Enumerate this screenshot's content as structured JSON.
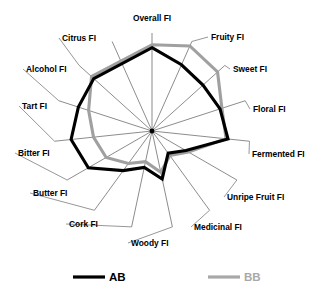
{
  "chart_data": {
    "type": "radar",
    "title": "",
    "subtitle": "",
    "xlabel": "",
    "ylabel": "",
    "grid": false,
    "legend_position": "bottom",
    "rlim": [
      0,
      10
    ],
    "axis_count": 15,
    "categories": [
      "Overall FI",
      "Fruity FI",
      "Sweet FI",
      "Floral FI",
      "Fermented FI",
      "Unripe Fruit FI",
      "Medicinal FI",
      "Woody FI",
      "Cork FI",
      "Butter FI",
      "Bitter FI",
      "Tart FI",
      "Alcohol FI",
      "Citrus FI"
    ],
    "series": [
      {
        "name": "AB",
        "color": "#000000",
        "values": [
          8.5,
          7.4,
          7.0,
          7.3,
          7.8,
          4.0,
          2.8,
          5.0,
          3.8,
          5.0,
          7.5,
          8.3,
          7.9,
          8.0
        ]
      },
      {
        "name": "BB",
        "color": "#a0a0a0",
        "values": [
          8.8,
          9.5,
          9.0,
          7.5,
          7.6,
          4.3,
          3.1,
          4.3,
          3.2,
          4.1,
          5.4,
          6.0,
          6.8,
          8.3
        ]
      }
    ]
  },
  "axis_labels": [
    {
      "text": "Overall FI",
      "x": 152,
      "y": 21,
      "anchor": "middle"
    },
    {
      "text": "Fruity FI",
      "x": 211,
      "y": 40,
      "anchor": "start"
    },
    {
      "text": "Sweet FI",
      "x": 233,
      "y": 72,
      "anchor": "start"
    },
    {
      "text": "Floral FI",
      "x": 253,
      "y": 112,
      "anchor": "start"
    },
    {
      "text": "Fermented FI",
      "x": 252,
      "y": 157,
      "anchor": "start"
    },
    {
      "text": "Unripe Fruit FI",
      "x": 227,
      "y": 200,
      "anchor": "start"
    },
    {
      "text": "Medicinal FI",
      "x": 194,
      "y": 230,
      "anchor": "start"
    },
    {
      "text": "Woody FI",
      "x": 131,
      "y": 246,
      "anchor": "start"
    },
    {
      "text": "Cork FI",
      "x": 69,
      "y": 227,
      "anchor": "start"
    },
    {
      "text": "Butter FI",
      "x": 33,
      "y": 196,
      "anchor": "start"
    },
    {
      "text": "Bitter FI",
      "x": 18,
      "y": 156,
      "anchor": "start"
    },
    {
      "text": "Tart FI",
      "x": 22,
      "y": 109,
      "anchor": "start"
    },
    {
      "text": "Alcohol FI",
      "x": 26,
      "y": 72,
      "anchor": "start"
    },
    {
      "text": "Citrus FI",
      "x": 62,
      "y": 41,
      "anchor": "start"
    }
  ],
  "legend": {
    "items": [
      {
        "label": "AB",
        "color": "#000000"
      },
      {
        "label": "BB",
        "color": "#a8a8a8"
      }
    ]
  }
}
